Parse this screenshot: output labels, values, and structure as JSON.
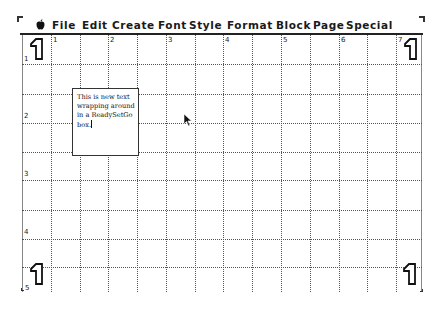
{
  "menubar": {
    "apple_icon": "apple-menu-icon",
    "items": [
      {
        "label": "File",
        "x": 52
      },
      {
        "label": "Edit",
        "x": 82
      },
      {
        "label": "Create",
        "x": 112
      },
      {
        "label": "Font",
        "x": 158
      },
      {
        "label": "Style",
        "x": 189
      },
      {
        "label": "Format",
        "x": 227
      },
      {
        "label": "Block",
        "x": 276
      },
      {
        "label": "Page",
        "x": 313
      },
      {
        "label": "Special",
        "x": 346
      }
    ]
  },
  "layout": {
    "column_labels": [
      "1",
      "2",
      "3",
      "4",
      "5",
      "6",
      "7"
    ],
    "row_labels": [
      "1",
      "2",
      "3",
      "4",
      "5"
    ],
    "page_number_glyph": "1"
  },
  "textbox": {
    "lines": [
      "This is new text",
      "wrapping around",
      "in a ReadySetGo",
      "box."
    ]
  },
  "colors": {
    "background": "#ffffff",
    "ink": "#111111",
    "grid": "#555555"
  }
}
